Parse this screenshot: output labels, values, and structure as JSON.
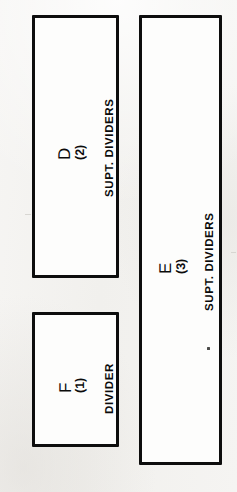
{
  "figure": {
    "type": "technical-line-drawing",
    "background_color": "#f4f3f1",
    "line_color": "#0d0d0d",
    "box_fill_color": "#fdfdfc",
    "text_orientation": "rotated-90-counterclockwise",
    "boxes": [
      {
        "id": "box-d",
        "letter": "D",
        "number": "(2)",
        "caption": "SUPT. DIVIDERS",
        "x": 32,
        "y": 15,
        "width": 87,
        "height": 263
      },
      {
        "id": "box-f",
        "letter": "F",
        "number": "(1)",
        "caption": "DIVIDER",
        "x": 32,
        "y": 312,
        "width": 87,
        "height": 135
      },
      {
        "id": "box-e",
        "letter": "E",
        "number": "(3)",
        "caption": "SUPT. DIVIDERS",
        "x": 139,
        "y": 15,
        "width": 83,
        "height": 450
      }
    ]
  }
}
